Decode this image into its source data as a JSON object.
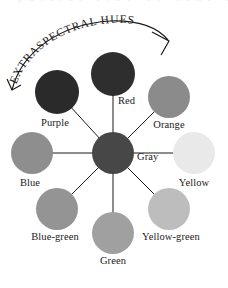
{
  "figure": {
    "kind": "color-wheel-diagram",
    "background_color": "#ffffff",
    "cropped_text_above": "partial line of text cropped at top edge"
  },
  "arc_annotation": {
    "label": "EXTRASPECTRAL HUES",
    "has_arrow": true,
    "arrow_direction": "clockwise-to-lower-right",
    "stroke_color": "#1a1a1a"
  },
  "center": {
    "label": "Gray",
    "color": "#474747",
    "cx": 113,
    "cy": 153,
    "r": 21,
    "label_x": 137,
    "label_y": 160
  },
  "spokes": {
    "count": 8,
    "stroke_color": "#1a1a1a"
  },
  "hues": [
    {
      "name": "Red",
      "color": "#2e2e2e",
      "cx": 113,
      "cy": 74,
      "r": 22,
      "label_x": 118,
      "label_y": 104,
      "label_anchor": "start"
    },
    {
      "name": "Orange",
      "color": "#8b8b8b",
      "cx": 169,
      "cy": 97,
      "r": 21,
      "label_x": 169,
      "label_y": 128,
      "label_anchor": "middle"
    },
    {
      "name": "Yellow",
      "color": "#e9e9e9",
      "cx": 194,
      "cy": 153,
      "r": 21,
      "label_x": 194,
      "label_y": 186,
      "label_anchor": "middle"
    },
    {
      "name": "Yellow-green",
      "color": "#bdbdbd",
      "cx": 169,
      "cy": 209,
      "r": 21,
      "label_x": 171,
      "label_y": 240,
      "label_anchor": "middle"
    },
    {
      "name": "Green",
      "color": "#a0a0a0",
      "cx": 113,
      "cy": 233,
      "r": 21,
      "label_x": 113,
      "label_y": 264,
      "label_anchor": "middle"
    },
    {
      "name": "Blue-green",
      "color": "#949494",
      "cx": 57,
      "cy": 209,
      "r": 21,
      "label_x": 55,
      "label_y": 240,
      "label_anchor": "middle"
    },
    {
      "name": "Blue",
      "color": "#8e8e8e",
      "cx": 32,
      "cy": 153,
      "r": 21,
      "label_x": 30,
      "label_y": 186,
      "label_anchor": "middle"
    },
    {
      "name": "Purple",
      "color": "#2a2a2a",
      "cx": 57,
      "cy": 92,
      "r": 22,
      "label_x": 55,
      "label_y": 126,
      "label_anchor": "middle"
    }
  ]
}
